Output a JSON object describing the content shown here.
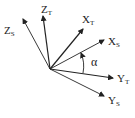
{
  "diagram": {
    "origin": [
      50,
      69
    ],
    "axes": [
      {
        "id": "z_t",
        "label": "Z",
        "sub": "T",
        "end": [
          43,
          16
        ],
        "label_pos": [
          41,
          13
        ]
      },
      {
        "id": "z_s",
        "label": "Z",
        "sub": "S",
        "end": [
          23,
          19
        ],
        "label_pos": [
          4,
          34
        ]
      },
      {
        "id": "x_t",
        "label": "X",
        "sub": "T",
        "end": [
          83,
          29
        ],
        "label_pos": [
          82,
          23
        ]
      },
      {
        "id": "x_s",
        "label": "X",
        "sub": "S",
        "end": [
          104,
          40
        ],
        "label_pos": [
          108,
          45
        ]
      },
      {
        "id": "y_t",
        "label": "Y",
        "sub": "T",
        "end": [
          113,
          78
        ],
        "label_pos": [
          117,
          82
        ]
      },
      {
        "id": "y_s",
        "label": "Y",
        "sub": "S",
        "end": [
          104,
          96
        ],
        "label_pos": [
          108,
          104
        ]
      }
    ],
    "angle": {
      "symbol": "α",
      "label_pos": [
        91,
        66
      ]
    },
    "colors": {
      "stroke": "#222222",
      "background": "#ffffff"
    }
  }
}
